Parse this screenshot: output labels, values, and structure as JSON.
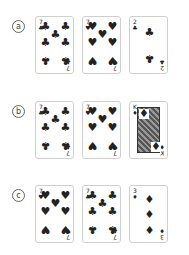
{
  "rows": [
    {
      "label": "a",
      "cards": [
        {
          "rank": "7",
          "suit": "♣",
          "name": "seven-of-clubs"
        },
        {
          "rank": "7",
          "suit": "♥",
          "name": "seven-of-hearts"
        },
        {
          "rank": "2",
          "suit": "♣",
          "name": "two-of-clubs"
        }
      ]
    },
    {
      "label": "b",
      "cards": [
        {
          "rank": "7",
          "suit": "♣",
          "name": "seven-of-clubs"
        },
        {
          "rank": "7",
          "suit": "♥",
          "name": "seven-of-hearts"
        },
        {
          "rank": "K",
          "suit": "♦",
          "name": "king-of-diamonds"
        }
      ]
    },
    {
      "label": "c",
      "cards": [
        {
          "rank": "7",
          "suit": "♥",
          "name": "seven-of-hearts"
        },
        {
          "rank": "7",
          "suit": "♣",
          "name": "seven-of-clubs"
        },
        {
          "rank": "3",
          "suit": "♦",
          "name": "three-of-diamonds"
        }
      ]
    }
  ]
}
